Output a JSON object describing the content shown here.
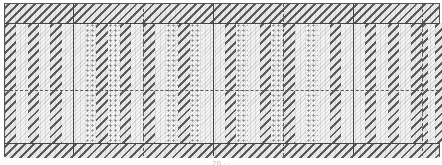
{
  "diagram": {
    "type": "weave-chart",
    "caption": "20 · ·",
    "colors": {
      "border": "#444444",
      "dark_stripe": "#5c5c5c",
      "light_hatch": "#dadada",
      "background": "#f4f4f4"
    },
    "top_band_height": 19,
    "bottom_band_height": 15,
    "columns_x": [
      0,
      68,
      138,
      208,
      278,
      348,
      417,
      436
    ],
    "vertical_lines": [
      {
        "x": 68,
        "style": "solid"
      },
      {
        "x": 138,
        "style": "dashed"
      },
      {
        "x": 208,
        "style": "solid"
      },
      {
        "x": 278,
        "style": "dashed"
      },
      {
        "x": 348,
        "style": "solid"
      },
      {
        "x": 417,
        "style": "dashed"
      }
    ],
    "horizontal_lines": [
      {
        "y": 19,
        "style": "solid"
      },
      {
        "y": 86,
        "style": "dashed"
      },
      {
        "y": 139,
        "style": "solid"
      }
    ],
    "panels": [
      {
        "x": 0,
        "pattern": [
          "dark",
          "light",
          "dark",
          "light",
          "dark",
          "light"
        ]
      },
      {
        "x": 68,
        "pattern": [
          "light",
          "dots",
          "dark",
          "dots",
          "dark",
          "light"
        ]
      },
      {
        "x": 138,
        "pattern": [
          "dark",
          "light",
          "dots",
          "dark",
          "dots",
          "light"
        ]
      },
      {
        "x": 208,
        "pattern": [
          "light",
          "dark",
          "dots",
          "light",
          "dark",
          "dots"
        ]
      },
      {
        "x": 278,
        "pattern": [
          "dark",
          "light",
          "dots",
          "light",
          "dark",
          "light"
        ]
      },
      {
        "x": 348,
        "pattern": [
          "light",
          "dark",
          "light",
          "dark",
          "light",
          "dark"
        ]
      },
      {
        "x": 417,
        "pattern": [
          "dark",
          "light",
          "dark"
        ]
      }
    ]
  }
}
